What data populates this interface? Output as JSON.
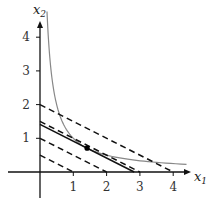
{
  "chart_data": {
    "type": "line",
    "title": "",
    "xlabel": "x1",
    "ylabel": "x2",
    "xlim": [
      -0.9,
      4.5
    ],
    "ylim": [
      -0.8,
      4.7
    ],
    "grid": false,
    "legend": null,
    "x_ticks": [
      1,
      2,
      3,
      4
    ],
    "y_ticks": [
      1,
      2,
      3,
      4
    ],
    "series": [
      {
        "name": "indifference curve x1*x2 = 1",
        "style": "solid-gray",
        "color": "#888888",
        "equation": "x2 = 1/x1",
        "x_range": [
          0.21,
          4.4
        ]
      },
      {
        "name": "budget/level line c=0.5",
        "style": "dashed",
        "color": "#111111",
        "equation": "x2 = 0.5 - x1/2",
        "points": [
          [
            0,
            0.5
          ],
          [
            1,
            0
          ]
        ]
      },
      {
        "name": "level line c=1",
        "style": "dashed",
        "color": "#111111",
        "equation": "x2 = 1 - x1/2",
        "points": [
          [
            0,
            1
          ],
          [
            2,
            0
          ]
        ]
      },
      {
        "name": "level line c=1.5",
        "style": "dashed",
        "color": "#111111",
        "equation": "x2 = 1.5 - x1/2",
        "points": [
          [
            0,
            1.5
          ],
          [
            3,
            0
          ]
        ]
      },
      {
        "name": "level line c=2",
        "style": "dashed",
        "color": "#111111",
        "equation": "x2 = 2 - x1/2",
        "points": [
          [
            0,
            2
          ],
          [
            4,
            0
          ]
        ]
      },
      {
        "name": "tangent line c=sqrt(2)",
        "style": "solid",
        "color": "#111111",
        "equation": "x2 = 1.414 - x1/2",
        "points": [
          [
            0,
            1.414
          ],
          [
            2.828,
            0
          ]
        ]
      }
    ],
    "annotations": [
      {
        "type": "point",
        "label": "tangency point",
        "x": 1.414,
        "y": 0.707
      }
    ]
  },
  "labels": {
    "x_axis": {
      "main": "x",
      "sub": "1"
    },
    "y_axis": {
      "main": "x",
      "sub": "2"
    },
    "ticks": {
      "x": [
        "1",
        "2",
        "3",
        "4"
      ],
      "y": [
        "1",
        "2",
        "3",
        "4"
      ]
    }
  }
}
